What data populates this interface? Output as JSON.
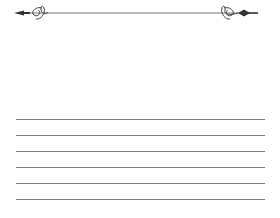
{
  "page": {
    "type": "lined writing template",
    "background": "#ffffff"
  },
  "header_ornament": {
    "icon": "flourish-divider-icon",
    "color": "#555555",
    "line_y": 13,
    "x_start": 14,
    "x_end": 258
  },
  "writing_lines": {
    "color": "#7a7a7a",
    "x_start": 16,
    "x_end": 265,
    "y_positions": [
      119,
      135,
      151,
      167,
      183,
      199
    ]
  }
}
